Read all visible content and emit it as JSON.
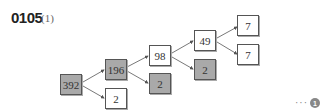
{
  "header": {
    "problem_number": "0105",
    "sub_label": "(1)"
  },
  "tree": {
    "nodes": [
      {
        "id": "n392",
        "value": "392",
        "shaded": true
      },
      {
        "id": "n196",
        "value": "196",
        "shaded": true
      },
      {
        "id": "n2a",
        "value": "2",
        "shaded": false
      },
      {
        "id": "n98",
        "value": "98",
        "shaded": false
      },
      {
        "id": "n2b",
        "value": "2",
        "shaded": true
      },
      {
        "id": "n49",
        "value": "49",
        "shaded": false
      },
      {
        "id": "n2c",
        "value": "2",
        "shaded": true
      },
      {
        "id": "n7a",
        "value": "7",
        "shaded": false
      },
      {
        "id": "n7b",
        "value": "7",
        "shaded": false
      }
    ],
    "edges": [
      [
        "392",
        "196"
      ],
      [
        "392",
        "2"
      ],
      [
        "196",
        "98"
      ],
      [
        "196",
        "2"
      ],
      [
        "98",
        "49"
      ],
      [
        "98",
        "2"
      ],
      [
        "49",
        "7"
      ],
      [
        "49",
        "7"
      ]
    ]
  },
  "footer": {
    "ellipsis": "···",
    "marker": "1"
  },
  "colors": {
    "shaded": "#a9a9a9",
    "border": "#555555"
  }
}
